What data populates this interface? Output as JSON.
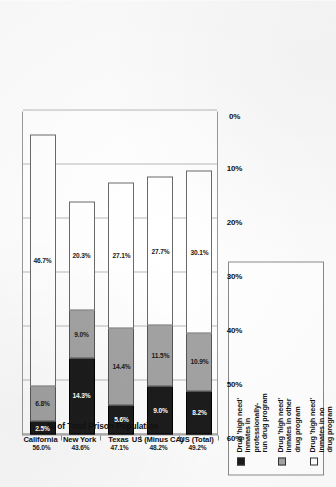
{
  "chart_data": {
    "type": "bar",
    "orientation": "horizontal-stacked",
    "title": "",
    "xlabel": "",
    "ylabel": "% of Total Prison Population",
    "ylim": [
      0,
      60
    ],
    "grid": true,
    "legend_position": "top-left-inset",
    "tick_labels": [
      "60%",
      "50%",
      "40%",
      "30%",
      "20%",
      "10%",
      "0%"
    ],
    "categories": [
      "California",
      "New York",
      "Texas",
      "US (Minus CA)",
      "US (Total)"
    ],
    "series": [
      {
        "name": "Drug 'high need'\ninmates in\nprofessionally-\nrun drug program",
        "color": "#1c1c1c",
        "values": [
          2.5,
          14.3,
          5.6,
          9.0,
          8.2
        ],
        "labels": [
          "2.5%",
          "14.3%",
          "5.6%",
          "9.0%",
          "8.2%"
        ]
      },
      {
        "name": "Drug 'high need'\ninmates in other\ndrug program",
        "color": "#a3a3a3",
        "values": [
          6.8,
          9.0,
          14.4,
          11.5,
          10.9
        ],
        "labels": [
          "6.8%",
          "9.0%",
          "14.4%",
          "11.5%",
          "10.9%"
        ]
      },
      {
        "name": "Drug 'high need'\ninmates in no\ndrug program",
        "color": "#ffffff",
        "values": [
          46.7,
          20.3,
          27.1,
          27.7,
          30.1
        ],
        "labels": [
          "46.7%",
          "20.3%",
          "27.1%",
          "27.7%",
          "30.1%"
        ]
      }
    ],
    "totals": [
      56.0,
      43.6,
      47.1,
      48.2,
      49.2
    ],
    "total_labels": [
      "56.0%",
      "43.6%",
      "47.1%",
      "48.2%",
      "49.2%"
    ]
  },
  "legend": {
    "items": [
      {
        "swatch": "black",
        "label": "Drug 'high need'\ninmates in\nprofessionally-\nrun drug program"
      },
      {
        "swatch": "gray",
        "label": "Drug 'high need'\ninmates in other\ndrug program"
      },
      {
        "swatch": "white",
        "label": "Drug 'high need'\ninmates in no\ndrug program"
      }
    ]
  },
  "axis": {
    "value_title": "% of Total Prison Population",
    "ticks": [
      "60%",
      "50%",
      "40%",
      "30%",
      "20%",
      "10%",
      "0%"
    ],
    "categories": [
      "California",
      "New York",
      "Texas",
      "US (Minus CA)",
      "US (Total)"
    ]
  }
}
